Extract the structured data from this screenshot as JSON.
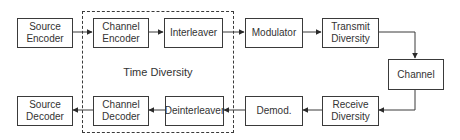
{
  "colors": {
    "stroke": "#3a3a3a",
    "text": "#333333",
    "background": "#ffffff"
  },
  "group": {
    "label": "Time Diversity"
  },
  "blocks": {
    "source_encoder": "Source\nEncoder",
    "channel_encoder": "Channel\nEncoder",
    "interleaver": "Interleaver",
    "modulator": "Modulator",
    "transmit_diversity": "Transmit\nDiversity",
    "channel": "Channel",
    "receive_diversity": "Receive\nDiversity",
    "demod": "Demod.",
    "deinterleaver": "Deinterleaver",
    "channel_decoder": "Channel\nDecoder",
    "source_decoder": "Source\nDecoder"
  },
  "edges": [
    [
      "Source Encoder",
      "Channel Encoder"
    ],
    [
      "Channel Encoder",
      "Interleaver"
    ],
    [
      "Interleaver",
      "Modulator"
    ],
    [
      "Modulator",
      "Transmit Diversity"
    ],
    [
      "Transmit Diversity",
      "Channel"
    ],
    [
      "Channel",
      "Receive Diversity"
    ],
    [
      "Receive Diversity",
      "Demod."
    ],
    [
      "Demod.",
      "Deinterleaver"
    ],
    [
      "Deinterleaver",
      "Channel Decoder"
    ],
    [
      "Channel Decoder",
      "Source Decoder"
    ]
  ]
}
